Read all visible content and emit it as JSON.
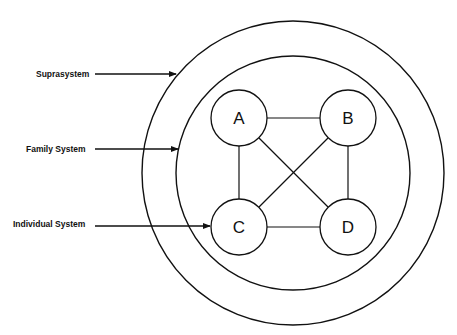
{
  "labels": {
    "suprasystem": "Suprasystem",
    "family_system": "Family System",
    "individual_system": "Individual System"
  },
  "nodes": [
    {
      "id": "A",
      "label": "A"
    },
    {
      "id": "B",
      "label": "B"
    },
    {
      "id": "C",
      "label": "C"
    },
    {
      "id": "D",
      "label": "D"
    }
  ],
  "edges": [
    [
      "A",
      "B"
    ],
    [
      "A",
      "C"
    ],
    [
      "A",
      "D"
    ],
    [
      "B",
      "C"
    ],
    [
      "B",
      "D"
    ],
    [
      "C",
      "D"
    ]
  ],
  "colors": {
    "stroke": "#111111",
    "background": "#ffffff"
  }
}
